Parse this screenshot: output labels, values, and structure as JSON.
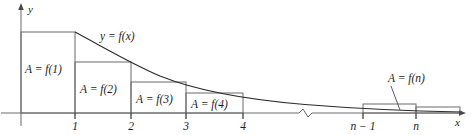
{
  "figure": {
    "type": "math-diagram",
    "background_color": "#ffffff",
    "line_color": "#4a4a4a",
    "curve_color": "#2b2b2b",
    "text_color": "#1c1c1c",
    "axes": {
      "x_axis_label": "x",
      "y_axis_label": "y",
      "x_axis_baseline_y": 113,
      "y_axis_x": 21,
      "x_axis_arrow_x": 462,
      "y_axis_arrow_y": 5,
      "has_break_mark": true,
      "break_mark_x": 305
    },
    "curve": {
      "label": "y = f(x)",
      "label_x": 100,
      "label_y": 40,
      "start_x": 75,
      "start_y": 32,
      "end_x": 462,
      "end_y": 107,
      "description": "decreasing convex curve"
    },
    "x_ticks": [
      {
        "label": "1",
        "x": 75
      },
      {
        "label": "2",
        "x": 131
      },
      {
        "label": "3",
        "x": 186
      },
      {
        "label": "4",
        "x": 243
      },
      {
        "label": "n − 1",
        "x": 363
      },
      {
        "label": "n",
        "x": 416
      }
    ],
    "rectangles": [
      {
        "label": "A = f(1)",
        "x0": 21,
        "x1": 75,
        "top": 32,
        "label_x": 25,
        "label_y": 73,
        "show_label": true
      },
      {
        "label": "A = f(2)",
        "x0": 75,
        "x1": 131,
        "top": 62,
        "label_x": 80,
        "label_y": 93,
        "show_label": true
      },
      {
        "label": "A = f(3)",
        "x0": 131,
        "x1": 186,
        "top": 82,
        "label_x": 136,
        "label_y": 103,
        "show_label": true
      },
      {
        "label": "A = f(4)",
        "x0": 186,
        "x1": 243,
        "top": 93,
        "label_x": 191,
        "label_y": 108,
        "show_label": true
      },
      {
        "label": "",
        "x0": 363,
        "x1": 416,
        "top": 104,
        "label_x": 0,
        "label_y": 0,
        "show_label": false
      },
      {
        "label": "",
        "x0": 416,
        "x1": 460,
        "top": 107,
        "label_x": 0,
        "label_y": 0,
        "show_label": false
      }
    ],
    "callout": {
      "label": "A = f(n)",
      "label_x": 388,
      "label_y": 82,
      "leader_from_x": 391,
      "leader_from_y": 86,
      "leader_to_x": 400,
      "leader_to_y": 110
    }
  }
}
